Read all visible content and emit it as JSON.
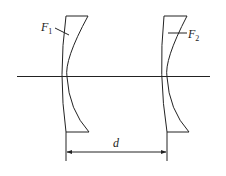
{
  "diagram": {
    "type": "optical-system",
    "colors": {
      "line": "#222222",
      "background": "#ffffff"
    },
    "lenses": [
      {
        "id": "lens-1",
        "label_main": "F",
        "label_sub": "1"
      },
      {
        "id": "lens-2",
        "label_main": "F",
        "label_sub": "2"
      }
    ],
    "dimension": {
      "label": "d"
    }
  }
}
